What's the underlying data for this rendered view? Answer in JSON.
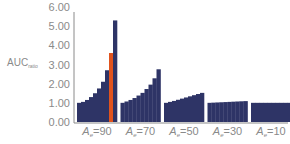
{
  "chart_data": {
    "type": "bar",
    "title": "",
    "ylabel": "AUC",
    "ylabel_subscript": "ratio",
    "xlabel": "",
    "ylim": [
      0,
      6
    ],
    "yticks": [
      "0.00",
      "1.00",
      "2.00",
      "3.00",
      "4.00",
      "5.00",
      "6.00"
    ],
    "grid": false,
    "colors": {
      "bar": "#2e3466",
      "highlight": "#e0531e",
      "axis": "#8a8a8a"
    },
    "groups": [
      {
        "label_main": "A",
        "label_sub": "e",
        "label_rest": "=90",
        "values": [
          1.0,
          1.05,
          1.15,
          1.3,
          1.5,
          1.75,
          2.1,
          2.7,
          3.6,
          5.3
        ],
        "highlight_index": 8
      },
      {
        "label_main": "A",
        "label_sub": "e",
        "label_rest": "=70",
        "values": [
          1.0,
          1.07,
          1.15,
          1.25,
          1.38,
          1.52,
          1.72,
          1.95,
          2.28,
          2.75
        ],
        "highlight_index": -1
      },
      {
        "label_main": "A",
        "label_sub": "e",
        "label_rest": "=50",
        "values": [
          1.0,
          1.05,
          1.1,
          1.16,
          1.22,
          1.28,
          1.34,
          1.4,
          1.46,
          1.52
        ],
        "highlight_index": -1
      },
      {
        "label_main": "A",
        "label_sub": "e",
        "label_rest": "=30",
        "values": [
          1.0,
          1.01,
          1.02,
          1.03,
          1.04,
          1.05,
          1.06,
          1.07,
          1.08,
          1.09
        ],
        "highlight_index": -1
      },
      {
        "label_main": "A",
        "label_sub": "e",
        "label_rest": "=10",
        "values": [
          1.0,
          1.0,
          1.0,
          1.0,
          1.0,
          1.0,
          1.0,
          1.0,
          1.0,
          1.0
        ],
        "highlight_index": -1
      }
    ]
  }
}
